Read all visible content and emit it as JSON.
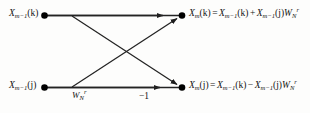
{
  "figure": {
    "name": "fft-butterfly-diagram",
    "stroke_color": "#222222",
    "node_color": "#000000",
    "background_color": "#fdfdfc"
  },
  "nodes": {
    "input_top": {
      "label_base": "X",
      "label_sub": "m−1",
      "label_arg": "(k)"
    },
    "input_bottom": {
      "label_base": "X",
      "label_sub": "m−1",
      "label_arg": "(j)"
    },
    "output_top": {
      "label_base": "X",
      "label_sub": "m",
      "label_arg": "(k)"
    },
    "output_bottom": {
      "label_base": "X",
      "label_sub": "m",
      "label_arg": "(j)"
    }
  },
  "equations": {
    "top": {
      "lhs_base": "X",
      "lhs_sub": "m",
      "lhs_arg": "(k)",
      "equals": "=",
      "t1_base": "X",
      "t1_sub": "m−1",
      "t1_arg": "(k)",
      "operator": "+",
      "t2_base": "X",
      "t2_sub": "m−1",
      "t2_arg": "(j)",
      "tw_base": "W",
      "tw_sub": "N",
      "tw_sup": "r",
      "plain": "X_m(k) = X_{m-1}(k) + X_{m-1}(j)W_N^r"
    },
    "bottom": {
      "lhs_base": "X",
      "lhs_sub": "m",
      "lhs_arg": "(j)",
      "equals": "=",
      "t1_base": "X",
      "t1_sub": "m−1",
      "t1_arg": "(k)",
      "operator": "−",
      "t2_base": "X",
      "t2_sub": "m−1",
      "t2_arg": "(j)",
      "tw_base": "W",
      "tw_sub": "N",
      "tw_sup": "r",
      "plain": "X_m(j) = X_{m-1}(k) - X_{m-1}(j)W_N^r"
    }
  },
  "edge_labels": {
    "twiddle": {
      "base": "W",
      "sub": "N",
      "sup": "r"
    },
    "minus_one": "−1"
  }
}
